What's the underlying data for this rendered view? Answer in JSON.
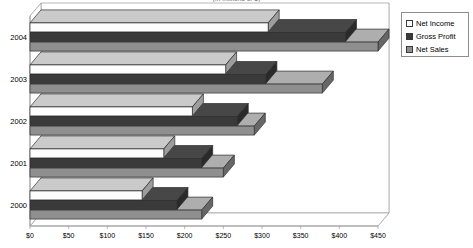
{
  "chart_data": {
    "type": "bar",
    "orientation": "horizontal",
    "style": "3d-grouped-bar",
    "title": "(in millions of $)",
    "xlabel": "",
    "ylabel": "",
    "categories": [
      "2000",
      "2001",
      "2002",
      "2003",
      "2004"
    ],
    "category_order_top_to_bottom": [
      "2004",
      "2003",
      "2002",
      "2001",
      "2000"
    ],
    "series": [
      {
        "name": "Net Income",
        "values": [
          145,
          173,
          210,
          253,
          308
        ],
        "color": "#fdfdfd"
      },
      {
        "name": "Gross Profit",
        "values": [
          190,
          222,
          268,
          305,
          408
        ],
        "color": "#3a3a3a"
      },
      {
        "name": "Net Sales",
        "values": [
          222,
          250,
          290,
          378,
          450
        ],
        "color": "#8f8f8f"
      }
    ],
    "xlim": [
      0,
      450
    ],
    "xticks": [
      0,
      50,
      100,
      150,
      200,
      250,
      300,
      350,
      400,
      450
    ],
    "xtick_labels": [
      "$0",
      "$50",
      "$100",
      "$150",
      "$200",
      "$250",
      "$300",
      "$350",
      "$400",
      "$450"
    ],
    "grid": true,
    "grid_axis": "x",
    "legend_position": "right",
    "legend_entries": [
      "Net Income",
      "Gross Profit",
      "Net Sales"
    ]
  },
  "legend": {
    "items": [
      {
        "label": "Net Income"
      },
      {
        "label": "Gross Profit"
      },
      {
        "label": "Net Sales"
      }
    ]
  },
  "axes": {
    "x_labels": [
      "$0",
      "$50",
      "$100",
      "$150",
      "$200",
      "$250",
      "$300",
      "$350",
      "$400",
      "$450"
    ],
    "y_labels": [
      "2004",
      "2003",
      "2002",
      "2001",
      "2000"
    ]
  },
  "colors": {
    "net_income": "#fdfdfd",
    "gross_profit": "#3a3a3a",
    "net_sales": "#8f8f8f",
    "axis": "#9a9a9a",
    "grid": "#b9b9b9",
    "text": "#000000"
  }
}
